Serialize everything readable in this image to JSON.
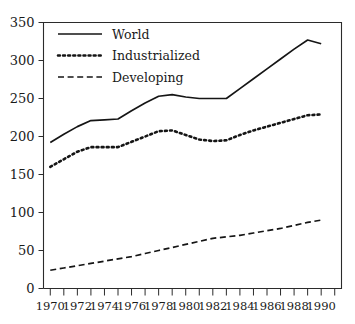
{
  "chart_data": {
    "type": "line",
    "title": "",
    "xlabel": "",
    "ylabel": "",
    "xlim": [
      1969.5,
      1991.5
    ],
    "ylim": [
      0,
      350
    ],
    "grid": false,
    "legend_position": "top-left",
    "y_ticks": [
      0,
      50,
      100,
      150,
      200,
      250,
      300,
      350
    ],
    "y_tick_labels": [
      "0",
      "50",
      "100",
      "150",
      "200",
      "250",
      "300",
      "350"
    ],
    "x_ticks": [
      1970,
      1971,
      1972,
      1973,
      1974,
      1975,
      1976,
      1977,
      1978,
      1979,
      1980,
      1981,
      1982,
      1983,
      1984,
      1985,
      1986,
      1987,
      1988,
      1989,
      1990,
      1991
    ],
    "x_tick_labels_shown": [
      "1970",
      "1972",
      "1974",
      "1976",
      "1978",
      "1980",
      "1982",
      "1984",
      "1986",
      "1988",
      "1990"
    ],
    "x_labeled_ticks": [
      1970,
      1972,
      1974,
      1976,
      1978,
      1980,
      1982,
      1984,
      1986,
      1988,
      1990
    ],
    "x": [
      1970,
      1971,
      1972,
      1973,
      1974,
      1975,
      1976,
      1977,
      1978,
      1979,
      1980,
      1981,
      1982,
      1983,
      1984,
      1985,
      1986,
      1987,
      1988,
      1989,
      1990
    ],
    "series": [
      {
        "name": "World",
        "style": "solid",
        "color": "#151515",
        "values": [
          192,
          203,
          213,
          221,
          222,
          223,
          234,
          244,
          253,
          255,
          252,
          250,
          250,
          250,
          263,
          276,
          289,
          302,
          315,
          327,
          322
        ]
      },
      {
        "name": "Industrialized",
        "style": "dotted",
        "color": "#151515",
        "values": [
          160,
          170,
          180,
          186,
          186,
          186,
          193,
          200,
          207,
          208,
          202,
          196,
          194,
          195,
          202,
          208,
          213,
          218,
          223,
          228,
          229
        ]
      },
      {
        "name": "Developing",
        "style": "dashed",
        "color": "#151515",
        "values": [
          24,
          27,
          30,
          33,
          36,
          39,
          42,
          46,
          50,
          54,
          58,
          62,
          66,
          68,
          70,
          73,
          76,
          79,
          83,
          87,
          90
        ]
      }
    ]
  },
  "legend": {
    "items": [
      {
        "label": "World"
      },
      {
        "label": "Industrialized"
      },
      {
        "label": "Developing"
      }
    ]
  }
}
